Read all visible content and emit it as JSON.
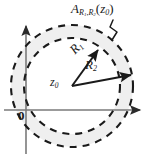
{
  "figure": {
    "title_label": "A",
    "annulus_label": {
      "base": "A",
      "sub_outer": "R",
      "sub_outer_index": "1",
      "sub_inner": "R",
      "sub_inner_index": "2",
      "argument_open": "(",
      "argument": "z",
      "argument_index": "0",
      "argument_close": ")",
      "full_text": "A_{R1,R2}(z0)"
    },
    "radius_inner": {
      "base": "R",
      "index": "1",
      "full_text": "R1"
    },
    "radius_outer": {
      "base": "R",
      "index": "2",
      "full_text": "R2"
    },
    "center": {
      "base": "z",
      "index": "0",
      "full_text": "z0"
    },
    "origin": {
      "label": "0"
    },
    "colors": {
      "stroke": "#1a1a1a",
      "axis": "#6e6e6e",
      "shading": "#efefef",
      "shading_edge": "#e6e6e6",
      "background": "#ffffff"
    },
    "geometry": {
      "center_x": 72,
      "center_y": 86,
      "inner_radius": 48,
      "outer_radius": 61,
      "axis_origin_x": 26,
      "axis_origin_y": 110,
      "r1_angle_deg": -48,
      "r2_angle_deg": -10
    },
    "icons": {
      "x_axis": "axis-arrow-right-icon",
      "y_axis": "axis-arrow-up-icon",
      "inner_circle": "dashed-circle-icon",
      "outer_circle": "dashed-circle-icon",
      "leader": "leader-line-icon"
    }
  }
}
